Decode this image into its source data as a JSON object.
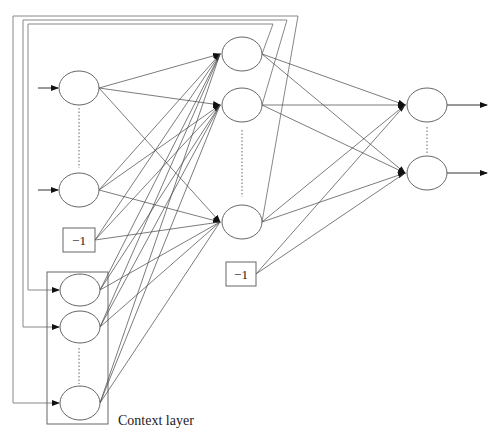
{
  "diagram": {
    "bias_label": "−1",
    "context_label": "Context layer",
    "colors": {
      "line": "#333333",
      "node": "#555555",
      "feedback": "#777777",
      "background": "#ffffff"
    },
    "layers": {
      "input": [
        {
          "cx": 79,
          "cy": 88
        },
        {
          "cx": 79,
          "cy": 190
        }
      ],
      "context": [
        {
          "cx": 80,
          "cy": 290
        },
        {
          "cx": 80,
          "cy": 327
        },
        {
          "cx": 80,
          "cy": 403
        }
      ],
      "hidden": [
        {
          "cx": 242,
          "cy": 54
        },
        {
          "cx": 242,
          "cy": 105
        },
        {
          "cx": 242,
          "cy": 222
        }
      ],
      "output": [
        {
          "cx": 427,
          "cy": 105
        },
        {
          "cx": 427,
          "cy": 173
        }
      ]
    },
    "bias_boxes": [
      {
        "name": "input-bias",
        "x": 63,
        "y": 228,
        "w": 32,
        "h": 24
      },
      {
        "name": "hidden-bias",
        "x": 226,
        "y": 262,
        "w": 30,
        "h": 24
      }
    ],
    "context_box": {
      "x": 47,
      "y": 272,
      "w": 61,
      "h": 152
    }
  }
}
